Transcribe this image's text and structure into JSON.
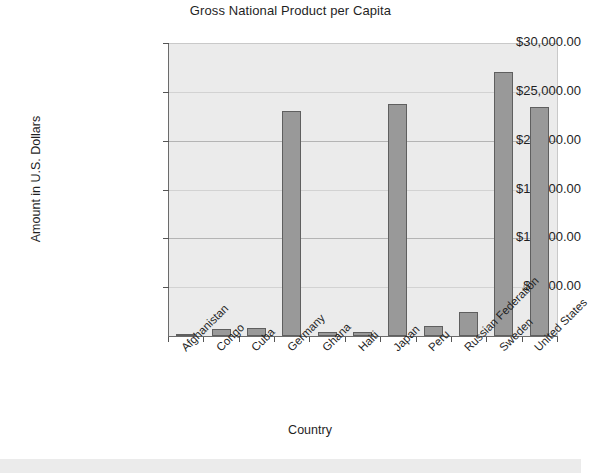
{
  "chart_data": {
    "type": "bar",
    "title": "Gross National Product per Capita",
    "xlabel": "Country",
    "ylabel": "Amount in U.S. Dollars",
    "categories": [
      "Afghanistan",
      "Congo",
      "Cuba",
      "Germany",
      "Ghana",
      "Haiti",
      "Japan",
      "Peru",
      "Russian Federation",
      "Sweden",
      "United States"
    ],
    "values": [
      250,
      750,
      800,
      23000,
      400,
      400,
      23800,
      1000,
      2500,
      27000,
      23400
    ],
    "ylim": [
      0,
      30000
    ],
    "ytick_values": [
      5000,
      10000,
      15000,
      20000,
      25000,
      30000
    ],
    "ytick_labels": [
      "$5,000.00",
      "$10,000.00",
      "$15,000.00",
      "$20,000.00",
      "$25,000.00",
      "$30,000.00"
    ],
    "grid": true,
    "legend": "none",
    "bar_color": "#999999",
    "bar_border_color": "#5f5f5f",
    "plot_background": "#ebebeb",
    "page_background": "#ffffff"
  }
}
